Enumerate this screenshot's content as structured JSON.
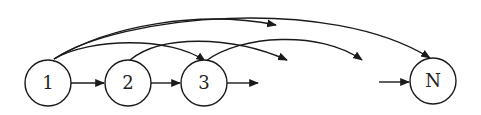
{
  "diagram": {
    "type": "directed-graph",
    "stroke_color": "#1a1a1a",
    "nodes": [
      {
        "id": "1",
        "label": "1",
        "cx": 48,
        "cy": 83,
        "r": 23
      },
      {
        "id": "2",
        "label": "2",
        "cx": 128,
        "cy": 83,
        "r": 23
      },
      {
        "id": "3",
        "label": "3",
        "cx": 204,
        "cy": 83,
        "r": 23
      },
      {
        "id": "N",
        "label": "N",
        "cx": 433,
        "cy": 81,
        "r": 23
      }
    ],
    "edges": [
      {
        "from": "1",
        "to": "2",
        "kind": "straight"
      },
      {
        "from": "2",
        "to": "3",
        "kind": "straight"
      },
      {
        "from": "3",
        "to": "…",
        "kind": "straight-open"
      },
      {
        "from": "…",
        "to": "N",
        "kind": "straight-open"
      },
      {
        "from": "1",
        "to": "3",
        "kind": "arc"
      },
      {
        "from": "1",
        "to": "…",
        "kind": "arc-open"
      },
      {
        "from": "1",
        "to": "N",
        "kind": "arc"
      },
      {
        "from": "2",
        "to": "…",
        "kind": "arc-open"
      },
      {
        "from": "3",
        "to": "…",
        "kind": "arc-open"
      }
    ]
  }
}
